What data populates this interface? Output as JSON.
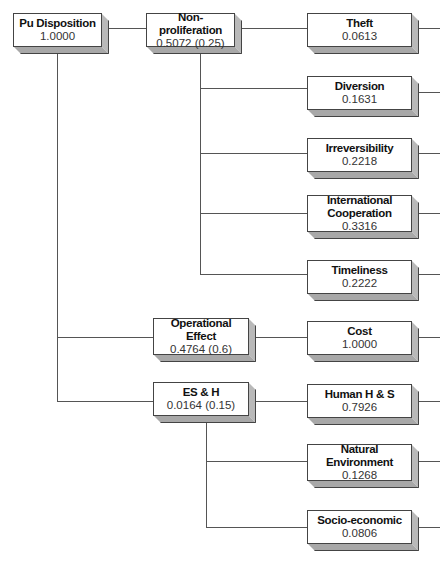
{
  "diagram": {
    "type": "hierarchy-tree",
    "root": {
      "name": "Pu Disposition",
      "value": "1.0000"
    },
    "level1": [
      {
        "name": "Non-proliferation",
        "value": "0.5072 (0.25)"
      },
      {
        "name": "Operational Effect",
        "value": "0.4764 (0.6)"
      },
      {
        "name": "ES & H",
        "value": "0.0164 (0.15)"
      }
    ],
    "level2": [
      {
        "parent": "Non-proliferation",
        "name": "Theft",
        "value": "0.0613"
      },
      {
        "parent": "Non-proliferation",
        "name": "Diversion",
        "value": "0.1631"
      },
      {
        "parent": "Non-proliferation",
        "name": "Irreversibility",
        "value": "0.2218"
      },
      {
        "parent": "Non-proliferation",
        "name": "International Cooperation",
        "value": "0.3316"
      },
      {
        "parent": "Non-proliferation",
        "name": "Timeliness",
        "value": "0.2222"
      },
      {
        "parent": "Operational Effect",
        "name": "Cost",
        "value": "1.0000"
      },
      {
        "parent": "ES & H",
        "name": "Human H & S",
        "value": "0.7926"
      },
      {
        "parent": "ES & H",
        "name": "Natural Environment",
        "value": "0.1268"
      },
      {
        "parent": "ES & H",
        "name": "Socio-economic",
        "value": "0.0806"
      }
    ]
  },
  "colors": {
    "line": "#555555",
    "face": "#ffffff",
    "side": "#b9b9b9",
    "bottom": "#a8a8a8"
  }
}
